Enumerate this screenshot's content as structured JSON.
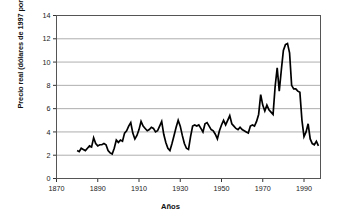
{
  "chart_data": {
    "type": "line",
    "title": "",
    "xlabel": "Años",
    "ylabel": "Precio real (dólares de 1997 por libra)",
    "xlim": [
      1870,
      1998
    ],
    "ylim": [
      0,
      14
    ],
    "xticks": [
      1870,
      1890,
      1910,
      1930,
      1950,
      1970,
      1990
    ],
    "xtick_labels": [
      "1870",
      "1890",
      "1910",
      "1930",
      "1950",
      "1970",
      "1990"
    ],
    "yticks": [
      0,
      2,
      4,
      6,
      8,
      10,
      12,
      14
    ],
    "ytick_labels": [
      "0",
      "2",
      "4",
      "6",
      "8",
      "10",
      "12",
      "14"
    ],
    "grid": "horizontal",
    "grid_color": "#999999",
    "line_color": "#000000",
    "line_width": 1.7,
    "frame_color": "#555555",
    "legend": "none",
    "series": [
      {
        "name": "Precio real del café",
        "x": [
          1880,
          1881,
          1882,
          1883,
          1884,
          1885,
          1886,
          1887,
          1888,
          1889,
          1890,
          1891,
          1892,
          1893,
          1894,
          1895,
          1896,
          1897,
          1898,
          1899,
          1900,
          1901,
          1902,
          1903,
          1904,
          1905,
          1906,
          1907,
          1908,
          1909,
          1910,
          1911,
          1912,
          1913,
          1914,
          1915,
          1916,
          1917,
          1918,
          1919,
          1920,
          1921,
          1922,
          1923,
          1924,
          1925,
          1926,
          1927,
          1928,
          1929,
          1930,
          1931,
          1932,
          1933,
          1934,
          1935,
          1936,
          1937,
          1938,
          1939,
          1940,
          1941,
          1942,
          1943,
          1944,
          1945,
          1946,
          1947,
          1948,
          1949,
          1950,
          1951,
          1952,
          1953,
          1954,
          1955,
          1956,
          1957,
          1958,
          1959,
          1960,
          1961,
          1962,
          1963,
          1964,
          1965,
          1966,
          1967,
          1968,
          1969,
          1970,
          1971,
          1972,
          1973,
          1974,
          1975,
          1976,
          1977,
          1978,
          1979,
          1980,
          1981,
          1982,
          1983,
          1984,
          1985,
          1986,
          1987,
          1988,
          1989,
          1990,
          1991,
          1992,
          1993,
          1994,
          1995,
          1996,
          1997
        ],
        "values": [
          2.4,
          2.3,
          2.6,
          2.5,
          2.4,
          2.6,
          2.8,
          2.7,
          3.5,
          3.0,
          2.8,
          2.9,
          2.9,
          3.0,
          2.9,
          2.4,
          2.2,
          2.1,
          2.6,
          3.3,
          3.1,
          3.3,
          3.2,
          3.9,
          4.1,
          4.5,
          4.8,
          3.9,
          3.4,
          3.7,
          4.2,
          4.9,
          4.5,
          4.3,
          4.1,
          4.2,
          4.4,
          4.3,
          4.0,
          4.1,
          4.5,
          4.9,
          3.8,
          3.1,
          2.6,
          2.4,
          3.0,
          3.7,
          4.4,
          5.0,
          4.5,
          3.7,
          3.0,
          2.6,
          2.5,
          3.6,
          4.5,
          4.6,
          4.5,
          4.6,
          4.3,
          4.0,
          4.7,
          4.8,
          4.5,
          4.2,
          4.1,
          3.8,
          3.4,
          4.1,
          4.6,
          5.0,
          4.6,
          5.0,
          5.4,
          4.7,
          4.5,
          4.3,
          4.2,
          4.4,
          4.2,
          4.1,
          4.0,
          3.9,
          4.5,
          4.6,
          4.5,
          4.9,
          5.5,
          7.2,
          6.3,
          5.8,
          6.3,
          5.9,
          5.7,
          5.5,
          7.9,
          9.5,
          7.5,
          9.3,
          11.0,
          11.5,
          11.6,
          10.8,
          8.0,
          7.7,
          7.7,
          7.5,
          7.4,
          5.0,
          3.6,
          4.0,
          4.7,
          3.4,
          3.0,
          2.9,
          3.2,
          2.8
        ]
      }
    ],
    "annotations": {
      "peak_year": 1982,
      "peak_value": 11.6,
      "min_value": 2.1,
      "min_year": 1897
    }
  }
}
